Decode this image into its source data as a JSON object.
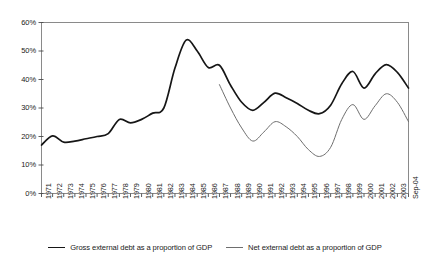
{
  "chart_data": {
    "type": "line",
    "title": "",
    "xlabel": "",
    "ylabel": "",
    "ylim": [
      0,
      60
    ],
    "ytick_labels": [
      "0%",
      "10%",
      "20%",
      "30%",
      "40%",
      "50%",
      "60%"
    ],
    "ytick_values": [
      0,
      10,
      20,
      30,
      40,
      50,
      60
    ],
    "grid": false,
    "legend_position": "bottom",
    "categories": [
      "1971",
      "1972",
      "1973",
      "1974",
      "1975",
      "1976",
      "1977",
      "1978",
      "1979",
      "1980",
      "1981",
      "1982",
      "1983",
      "1984",
      "1985",
      "1986",
      "1987",
      "1988",
      "1989",
      "1990",
      "1991",
      "1992",
      "1993",
      "1994",
      "1995",
      "1996",
      "1997",
      "1998",
      "1999",
      "2000",
      "2001",
      "2002",
      "2003",
      "Sep-04"
    ],
    "series": [
      {
        "name": "Gross external debt as a proportion of GDP",
        "color": "#161616",
        "width": 1.7,
        "values": [
          17.0,
          20.2,
          18.0,
          18.4,
          19.2,
          20.0,
          21.0,
          26.0,
          24.8,
          26.0,
          28.2,
          30.0,
          44.0,
          53.8,
          50.0,
          44.2,
          45.0,
          38.0,
          32.0,
          29.2,
          32.0,
          35.2,
          33.6,
          31.6,
          29.2,
          28.0,
          31.0,
          38.5,
          42.8,
          37.0,
          42.0,
          45.2,
          42.5,
          37.0
        ]
      },
      {
        "name": "Net external debt as a proportion of GDP",
        "color": "#6e6e6e",
        "width": 1.0,
        "values": [
          null,
          null,
          null,
          null,
          null,
          null,
          null,
          null,
          null,
          null,
          null,
          null,
          null,
          null,
          null,
          null,
          38.2,
          30.0,
          23.0,
          18.4,
          21.6,
          25.2,
          23.4,
          20.0,
          15.4,
          13.0,
          16.2,
          26.0,
          31.2,
          26.0,
          30.8,
          35.0,
          32.0,
          25.2
        ]
      }
    ]
  },
  "legend": {
    "entries": [
      {
        "label": "Gross external debt as a proportion of GDP",
        "swatch": "thick-black-line"
      },
      {
        "label": "Net external debt as a proportion of GDP",
        "swatch": "thin-gray-line"
      }
    ]
  }
}
